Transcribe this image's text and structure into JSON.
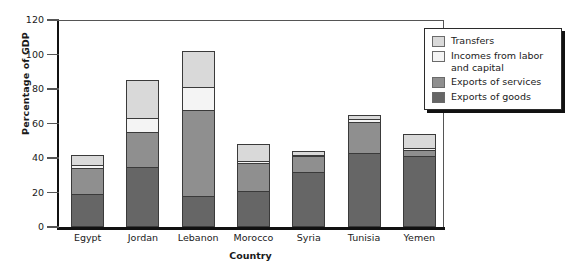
{
  "chart_data": {
    "type": "bar",
    "stacked": true,
    "title": "",
    "xlabel": "Country",
    "ylabel": "Percentage of GDP",
    "categories": [
      "Egypt",
      "Jordan",
      "Lebanon",
      "Morocco",
      "Syria",
      "Tunisia",
      "Yemen"
    ],
    "ylim": [
      0,
      120
    ],
    "yticks": [
      0,
      20,
      40,
      60,
      80,
      100,
      120
    ],
    "grid": false,
    "legend_position": "top-right",
    "series": [
      {
        "name": "Exports of goods",
        "color": "#666666",
        "values": [
          19,
          35,
          18,
          21,
          32,
          43,
          41
        ]
      },
      {
        "name": "Exports of services",
        "color": "#8f8f8f",
        "values": [
          15,
          20,
          50,
          16,
          9,
          18,
          3.5
        ]
      },
      {
        "name": "Incomes from labor and capital",
        "color": "#f4f4f4",
        "values": [
          2,
          8,
          13,
          1,
          1,
          1.5,
          1.5
        ]
      },
      {
        "name": "Transfers",
        "color": "#d9d9d9",
        "values": [
          6,
          22,
          21,
          10,
          2,
          2.5,
          8
        ]
      }
    ],
    "totals": [
      42,
      85,
      102,
      48,
      44,
      65,
      54
    ]
  },
  "legend": {
    "items": [
      {
        "label": "Transfers",
        "color": "#d9d9d9"
      },
      {
        "label": "Incomes from labor and capital",
        "color": "#f4f4f4"
      },
      {
        "label": "Exports of services",
        "color": "#8f8f8f"
      },
      {
        "label": "Exports of goods",
        "color": "#666666"
      }
    ]
  }
}
